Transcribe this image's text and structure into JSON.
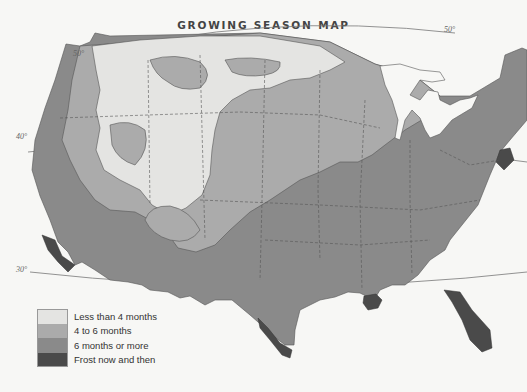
{
  "map": {
    "title": "GROWING SEASON MAP",
    "latitude_labels": [
      {
        "label": "50°",
        "position": "top-left"
      },
      {
        "label": "50°",
        "position": "top-right"
      },
      {
        "label": "40°",
        "position": "left"
      },
      {
        "label": "30°",
        "position": "bottom-left"
      }
    ]
  },
  "legend": {
    "items": [
      {
        "label": "Less than 4 months",
        "color": "#e4e4e2"
      },
      {
        "label": "4 to 6 months",
        "color": "#ababab"
      },
      {
        "label": "6 months or more",
        "color": "#8a8a8a"
      },
      {
        "label": "Frost now and then",
        "color": "#4a4a4a"
      }
    ]
  },
  "colors": {
    "background": "#f7f7f5",
    "water": "#f7f7f5",
    "border": "#555555"
  }
}
